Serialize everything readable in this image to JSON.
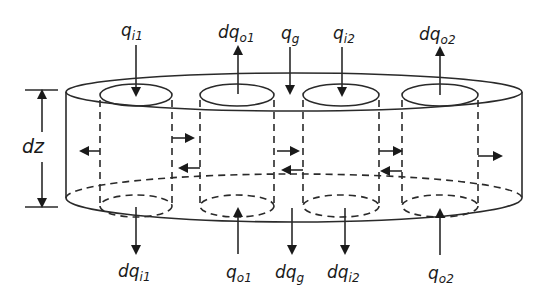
{
  "diagram": {
    "type": "cylindrical control volume with four inner flow tubes",
    "colors": {
      "line": "#2a2a2a",
      "background": "#ffffff"
    },
    "height_label": {
      "main": "dz",
      "sub": ""
    },
    "top_labels": [
      {
        "main": "q",
        "sub": "i1",
        "direction": "down"
      },
      {
        "main": "dq",
        "sub": "o1",
        "direction": "up"
      },
      {
        "main": "q",
        "sub": "g",
        "direction": "down"
      },
      {
        "main": "q",
        "sub": "i2",
        "direction": "down"
      },
      {
        "main": "dq",
        "sub": "o2",
        "direction": "up"
      }
    ],
    "bottom_labels": [
      {
        "main": "dq",
        "sub": "i1",
        "direction": "down"
      },
      {
        "main": "q",
        "sub": "o1",
        "direction": "up"
      },
      {
        "main": "dq",
        "sub": "g",
        "direction": "down"
      },
      {
        "main": "dq",
        "sub": "i2",
        "direction": "down"
      },
      {
        "main": "q",
        "sub": "o2",
        "direction": "up"
      }
    ]
  }
}
